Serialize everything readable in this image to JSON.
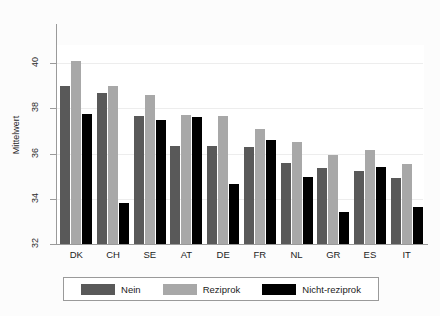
{
  "chart_data": {
    "type": "bar",
    "title": "",
    "xlabel": "",
    "ylabel": "Mittelwert",
    "ylim": [
      32,
      40.8
    ],
    "yticks": [
      32,
      34,
      36,
      38,
      40
    ],
    "ytick_labels": [
      "32",
      "34",
      "36",
      "38",
      "40"
    ],
    "grid": true,
    "legend_position": "bottom",
    "categories": [
      "DK",
      "CH",
      "SE",
      "AT",
      "DE",
      "FR",
      "NL",
      "GR",
      "ES",
      "IT"
    ],
    "series": [
      {
        "name": "Nein",
        "color": "#595959",
        "values": [
          39.0,
          38.7,
          37.65,
          36.35,
          36.35,
          36.3,
          35.6,
          35.35,
          35.25,
          34.9
        ]
      },
      {
        "name": "Reziprok",
        "color": "#a8a8a8",
        "values": [
          40.1,
          39.0,
          38.6,
          37.7,
          37.65,
          37.1,
          36.5,
          35.95,
          36.15,
          35.55
        ]
      },
      {
        "name": "Nicht-reziprok",
        "color": "#000000",
        "values": [
          37.75,
          33.8,
          37.5,
          37.6,
          34.65,
          36.6,
          34.95,
          33.4,
          35.4,
          33.65
        ]
      }
    ]
  },
  "legend": {
    "entries": [
      {
        "label": "Nein",
        "color": "#595959"
      },
      {
        "label": "Reziprok",
        "color": "#a8a8a8"
      },
      {
        "label": "Nicht-reziprok",
        "color": "#000000"
      }
    ]
  }
}
